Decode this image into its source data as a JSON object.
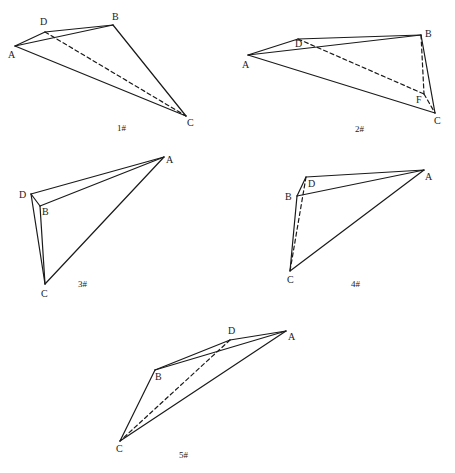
{
  "diagrams": [
    {
      "caption": "1#",
      "caption_pos": [
        117,
        131
      ],
      "points": {
        "A": [
          15,
          46
        ],
        "D": [
          45,
          32
        ],
        "B": [
          113,
          25
        ],
        "C": [
          186,
          116
        ]
      },
      "labels": {
        "A": [
          8,
          58
        ],
        "D": [
          40,
          25
        ],
        "B": [
          112,
          20
        ],
        "C": [
          187,
          126
        ]
      },
      "solid": [
        [
          "A",
          "D"
        ],
        [
          "D",
          "B"
        ],
        [
          "A",
          "B"
        ],
        [
          "B",
          "C"
        ],
        [
          "A",
          "C"
        ]
      ],
      "dashed": [
        [
          "D",
          "C"
        ]
      ]
    },
    {
      "caption": "2#",
      "caption_pos": [
        355,
        132
      ],
      "points": {
        "A": [
          248,
          55
        ],
        "D": [
          298,
          39
        ],
        "B": [
          421,
          35
        ],
        "C": [
          435,
          113
        ],
        "F": [
          424,
          94
        ]
      },
      "labels": {
        "A": [
          242,
          68
        ],
        "D": [
          295,
          47
        ],
        "B": [
          425,
          37
        ],
        "C": [
          434,
          124
        ],
        "F": [
          416,
          103
        ]
      },
      "solid": [
        [
          "A",
          "D"
        ],
        [
          "D",
          "B"
        ],
        [
          "A",
          "B"
        ],
        [
          "B",
          "C"
        ],
        [
          "A",
          "C"
        ]
      ],
      "dashed": [
        [
          "D",
          "F"
        ],
        [
          "B",
          "F"
        ],
        [
          "F",
          "C"
        ]
      ]
    },
    {
      "caption": "3#",
      "caption_pos": [
        78,
        287
      ],
      "points": {
        "A": [
          164,
          157
        ],
        "D": [
          31,
          194
        ],
        "B": [
          40,
          206
        ],
        "C": [
          45,
          284
        ]
      },
      "labels": {
        "A": [
          166,
          163
        ],
        "D": [
          19,
          198
        ],
        "B": [
          42,
          215
        ],
        "C": [
          41,
          297
        ]
      },
      "solid": [
        [
          "D",
          "A"
        ],
        [
          "B",
          "A"
        ],
        [
          "D",
          "B"
        ],
        [
          "D",
          "C"
        ],
        [
          "B",
          "C"
        ],
        [
          "A",
          "C"
        ]
      ],
      "dashed": []
    },
    {
      "caption": "4#",
      "caption_pos": [
        351,
        287
      ],
      "points": {
        "A": [
          424,
          170
        ],
        "D": [
          306,
          177
        ],
        "B": [
          297,
          196
        ],
        "C": [
          290,
          271
        ]
      },
      "labels": {
        "A": [
          425,
          180
        ],
        "D": [
          308,
          187
        ],
        "B": [
          285,
          200
        ],
        "C": [
          287,
          283
        ]
      },
      "solid": [
        [
          "D",
          "A"
        ],
        [
          "B",
          "A"
        ],
        [
          "D",
          "B"
        ],
        [
          "B",
          "C"
        ],
        [
          "A",
          "C"
        ]
      ],
      "dashed": [
        [
          "D",
          "C"
        ]
      ]
    },
    {
      "caption": "5#",
      "caption_pos": [
        179,
        458
      ],
      "points": {
        "A": [
          286,
          331
        ],
        "D": [
          230,
          340
        ],
        "B": [
          155,
          370
        ],
        "C": [
          120,
          441
        ]
      },
      "labels": {
        "A": [
          288,
          340
        ],
        "D": [
          228,
          334
        ],
        "B": [
          155,
          380
        ],
        "C": [
          116,
          452
        ]
      },
      "solid": [
        [
          "B",
          "D"
        ],
        [
          "D",
          "A"
        ],
        [
          "B",
          "A"
        ],
        [
          "B",
          "C"
        ],
        [
          "A",
          "C"
        ]
      ],
      "dashed": [
        [
          "D",
          "C"
        ]
      ]
    }
  ]
}
